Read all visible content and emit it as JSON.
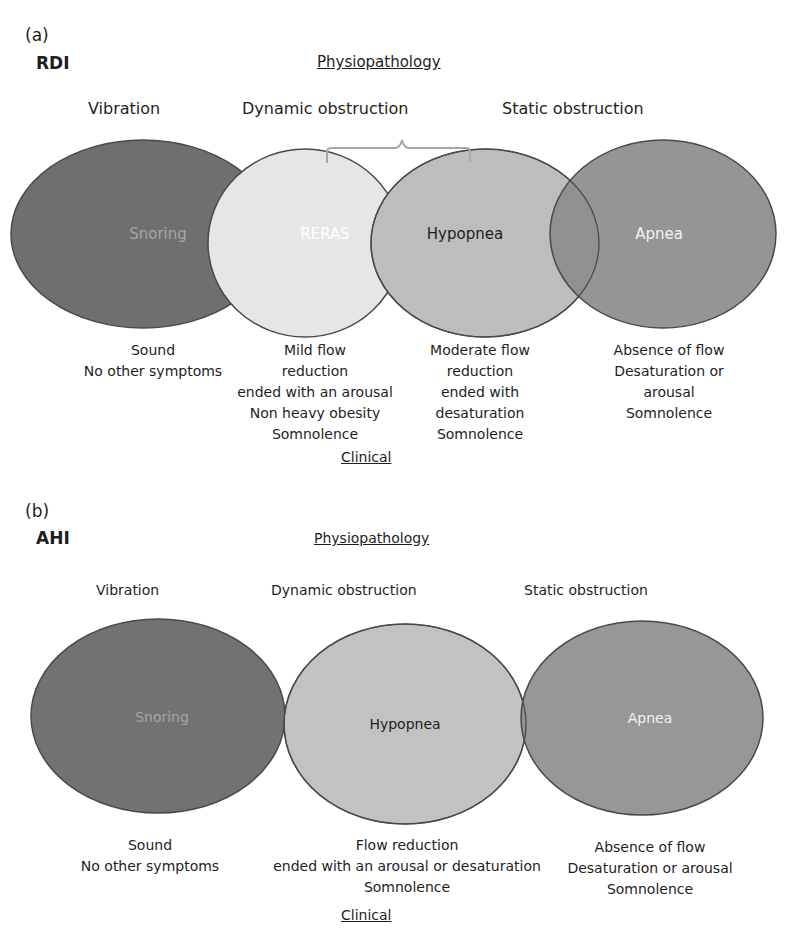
{
  "panel_a": {
    "letter": "(a)",
    "metric": "RDI",
    "physiopathology_title": "Physiopathology",
    "clinical_title": "Clinical",
    "categories": [
      {
        "label": "Vibration"
      },
      {
        "label": "Dynamic obstruction"
      },
      {
        "label": "Static obstruction"
      }
    ],
    "events": [
      {
        "label": "Snoring",
        "fill": "#6f6f6f",
        "text_color": "#a6a6a6",
        "description": [
          "Sound",
          "No other symptoms"
        ]
      },
      {
        "label": "RERAS",
        "fill": "#e6e6e6",
        "text_color": "#ffffff",
        "description": [
          "Mild flow",
          "reduction",
          "ended with an arousal",
          "Non heavy obesity",
          "Somnolence"
        ]
      },
      {
        "label": "Hypopnea",
        "fill": "#bdbdbd",
        "text_color": "#1e1e1e",
        "description": [
          "Moderate flow",
          "reduction",
          "ended with",
          "desaturation",
          "Somnolence"
        ]
      },
      {
        "label": "Apnea",
        "fill": "#8c8c8c",
        "text_color": "#f2f2f2",
        "description": [
          "Absence of flow",
          "Desaturation or",
          "arousal",
          "Somnolence"
        ]
      }
    ]
  },
  "panel_b": {
    "letter": "(b)",
    "metric": "AHI",
    "physiopathology_title": "Physiopathology",
    "clinical_title": "Clinical",
    "categories": [
      {
        "label": "Vibration"
      },
      {
        "label": "Dynamic obstruction"
      },
      {
        "label": "Static obstruction"
      }
    ],
    "events": [
      {
        "label": "Snoring",
        "fill": "#727272",
        "text_color": "#a6a6a6",
        "description": [
          "Sound",
          "No other symptoms"
        ]
      },
      {
        "label": "Hypopnea",
        "fill": "#c2c2c2",
        "text_color": "#1e1e1e",
        "description": [
          "Flow reduction",
          "ended with an arousal or desaturation",
          "Somnolence"
        ]
      },
      {
        "label": "Apnea",
        "fill": "#8e8e8e",
        "text_color": "#f2f2f2",
        "description": [
          "Absence of flow",
          "Desaturation or arousal",
          "Somnolence"
        ]
      }
    ]
  },
  "colors": {
    "outline": "#4a4a4a",
    "brace": "#a8a8a8",
    "text": "#1e1e1e"
  }
}
